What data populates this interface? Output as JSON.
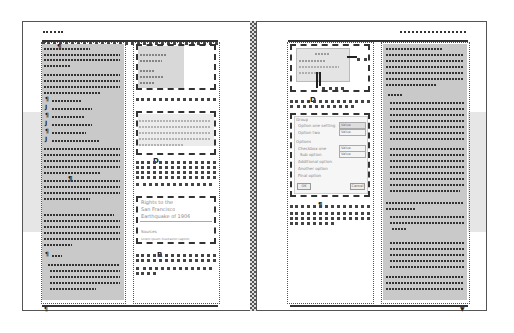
{
  "illustration": {
    "description": "Two-page document spread wireframe with greeked text, frames, and placeholder images",
    "colors": {
      "frame_border": "#555555",
      "text_column_bg": "#c9c9c9",
      "side_band": "#e6e6e6",
      "scribble": "#333333",
      "background": "#ffffff"
    }
  },
  "left_page": {
    "header_mark": "wwww",
    "markers": {
      "column_anchor": "¶",
      "list_markers": [
        "¶",
        "J",
        "¶",
        "J",
        "¶",
        "J"
      ],
      "inline_anchor": "¶",
      "section_anchor": "¶",
      "footer_mark": "¶"
    },
    "right_column": {
      "box1_lines": [
        "",
        "",
        "",
        "",
        ""
      ],
      "box2_caption_marker": "D",
      "box3_marker": "R",
      "quote_box": {
        "lines": [
          "Rights to the",
          "San Francisco",
          "Earthquake of 1906",
          "Sources",
          "Lorem ipsum illustration caption"
        ]
      }
    },
    "footer_marker": "¶"
  },
  "right_page": {
    "header_mark": "wwwwwwwwwwwwwwwwww",
    "image_box": {
      "caption_marker": "D"
    },
    "dialog": {
      "section1_title": "Group",
      "rows": [
        {
          "label": "Option one setting",
          "value": "Value"
        },
        {
          "label": "Option two",
          "value": "Value"
        }
      ],
      "section2_title": "Options",
      "options": [
        {
          "label": "Checkbox one",
          "value": "Value"
        },
        {
          "label": "Sub option",
          "value": "Value"
        },
        {
          "label": "Additional option"
        },
        {
          "label": "Another option"
        },
        {
          "label": "Final option"
        }
      ],
      "ok_label": "OK",
      "cancel_label": "Cancel"
    },
    "caption_marker": "¶",
    "footer_marker": "▼"
  }
}
